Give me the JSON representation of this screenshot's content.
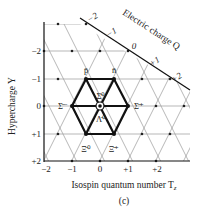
{
  "figure": {
    "caption": "(c)",
    "x_axis": {
      "label": "Isospin quantum number T",
      "label_sub": "z",
      "ticks": [
        "−2",
        "−1",
        "0",
        "+1",
        "+2"
      ]
    },
    "y_axis": {
      "label": "Hypercharge Y",
      "ticks": [
        "−2",
        "−1",
        "0",
        "+1",
        "+2"
      ]
    },
    "charge_axis": {
      "label": "Electric charge Q",
      "ticks": [
        "−2",
        "−1",
        "0",
        "+1",
        "+2"
      ]
    },
    "particles": [
      {
        "name": "p̄",
        "tz": -0.5,
        "y": -1
      },
      {
        "name": "n̄",
        "tz": 0.5,
        "y": -1
      },
      {
        "name": "Σ̄⁻",
        "tz": -1,
        "y": 0
      },
      {
        "name": "Σ̄⁺",
        "tz": 1,
        "y": 0
      },
      {
        "name": "Σ̄⁰",
        "tz": 0,
        "y": 0
      },
      {
        "name": "Λ̄⁰",
        "tz": 0,
        "y": 0
      },
      {
        "name": "Ξ̄⁰",
        "tz": -0.5,
        "y": 1
      },
      {
        "name": "Ξ̄⁺",
        "tz": 0.5,
        "y": 1
      }
    ]
  }
}
